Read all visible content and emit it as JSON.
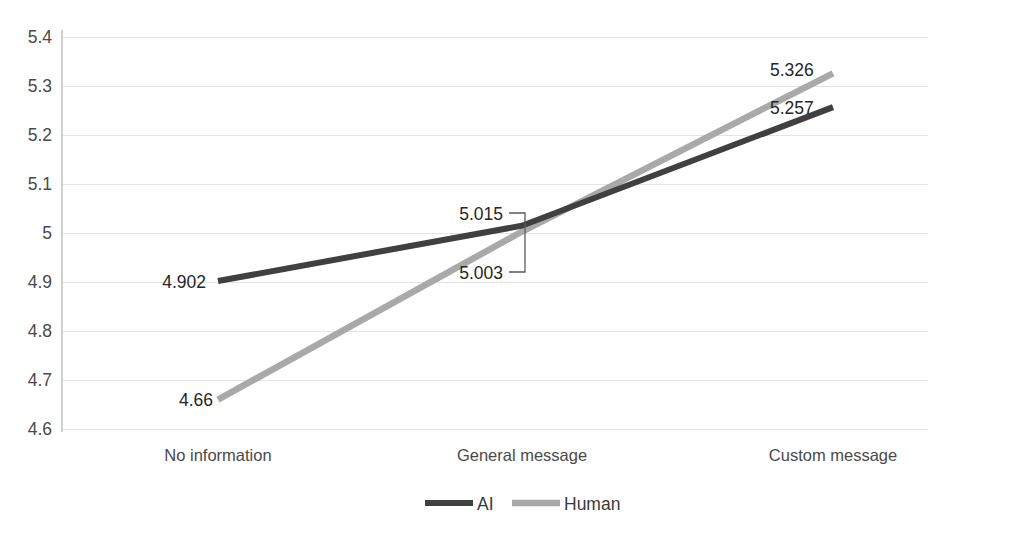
{
  "chart_data": {
    "type": "line",
    "title": "",
    "xlabel": "",
    "ylabel": "",
    "categories": [
      "No information",
      "General message",
      "Custom message"
    ],
    "series": [
      {
        "name": "AI",
        "color": "#404040",
        "values": [
          4.902,
          5.015,
          5.257
        ],
        "labels": [
          "4.902",
          "5.015",
          "5.257"
        ]
      },
      {
        "name": "Human",
        "color": "#a9a9a9",
        "values": [
          4.66,
          5.003,
          5.326
        ],
        "labels": [
          "4.66",
          "5.003",
          "5.326"
        ]
      }
    ],
    "ylim": [
      4.6,
      5.4
    ],
    "yticks": [
      5.4,
      5.3,
      5.2,
      5.1,
      5.0,
      4.9,
      4.8,
      4.7,
      4.6
    ],
    "ytick_labels": [
      "5.4",
      "5.3",
      "5.2",
      "5.1",
      "5",
      "4.9",
      "4.8",
      "4.7",
      "4.6"
    ],
    "grid": true,
    "legend_position": "bottom",
    "legend": [
      {
        "label": "AI",
        "color": "#404040"
      },
      {
        "label": "Human",
        "color": "#a9a9a9"
      }
    ],
    "annotations": {
      "midpoint_bracket": {
        "upper_label": "5.015",
        "lower_label": "5.003"
      }
    }
  },
  "axis": {
    "y_ticks": {
      "t0": "5.4",
      "t1": "5.3",
      "t2": "5.2",
      "t3": "5.1",
      "t4": "5",
      "t5": "4.9",
      "t6": "4.8",
      "t7": "4.7",
      "t8": "4.6"
    },
    "x_categories": {
      "c0": "No information",
      "c1": "General message",
      "c2": "Custom message"
    }
  },
  "data_labels": {
    "ai_left": "4.902",
    "ai_mid": "5.015",
    "ai_right": "5.257",
    "human_left": "4.66",
    "human_mid": "5.003",
    "human_right": "5.326"
  },
  "legend": {
    "ai": "AI",
    "human": "Human"
  },
  "colors": {
    "ai": "#404040",
    "human": "#a9a9a9",
    "grid": "#e4e4e4",
    "text": "#4a4a4a"
  }
}
